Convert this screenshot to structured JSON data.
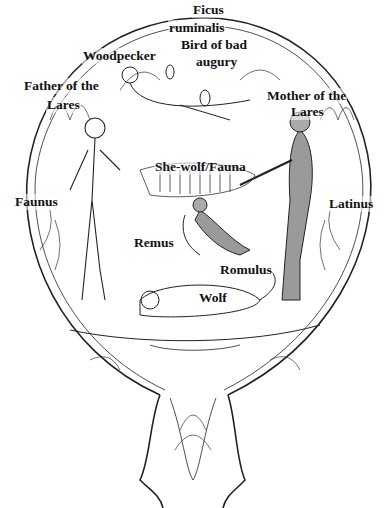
{
  "figure": {
    "colors": {
      "line": "#222222",
      "shade": "#9a9a9a",
      "background": "#ffffff"
    }
  },
  "labels": {
    "ficus_1": "Ficus",
    "ficus_2": "ruminalis",
    "bird_1": "Bird of bad",
    "bird_2": "augury",
    "woodpecker": "Woodpecker",
    "father_1": "Father of the",
    "father_2": "Lares",
    "mother_1": "Mother of the",
    "mother_2": "Lares",
    "shewolf": "She-wolf/Fauna",
    "faunus": "Faunus",
    "latinus": "Latinus",
    "remus": "Remus",
    "romulus": "Romulus",
    "wolf": "Wolf"
  }
}
